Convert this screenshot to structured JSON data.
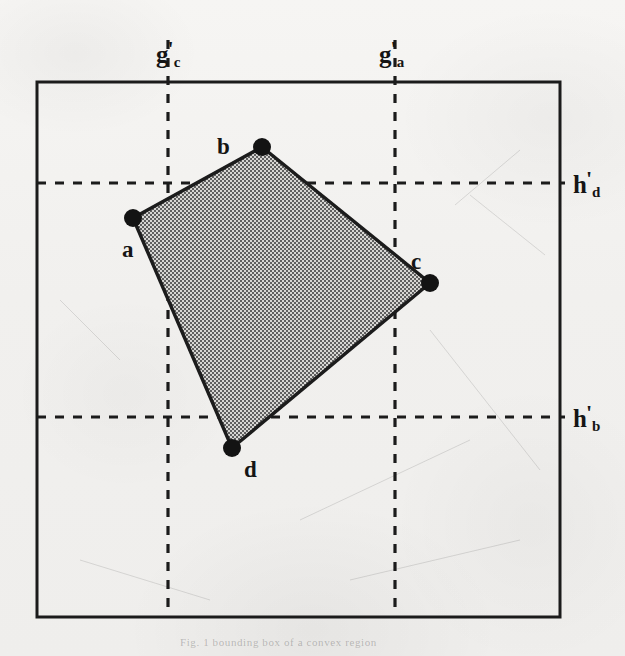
{
  "figure": {
    "background_color": "#f1f0ee",
    "ink_color": "#151515",
    "fill_color": "#8a8a8a",
    "canvas": {
      "width": 625,
      "height": 656
    },
    "frame": {
      "name": "bounding-box",
      "x": 37,
      "y": 82,
      "width": 523,
      "height": 535,
      "stroke_width": 3,
      "color": "#1b1b1b"
    },
    "axis_lines": [
      {
        "id": "g-prime-c",
        "orientation": "vertical",
        "position": 168,
        "label_main": "g",
        "label_sub": "c",
        "label_prime": "'",
        "label_x": 156,
        "label_y": 38,
        "style": "dashed",
        "color": "#1b1b1b"
      },
      {
        "id": "g-prime-a",
        "orientation": "vertical",
        "position": 395,
        "label_main": "g",
        "label_sub": "a",
        "label_prime": "'",
        "label_x": 379,
        "label_y": 38,
        "style": "dashed",
        "color": "#1b1b1b"
      },
      {
        "id": "h-prime-d",
        "orientation": "horizontal",
        "position": 183,
        "label_main": "h",
        "label_sub": "d",
        "label_prime": "'",
        "label_x": 573,
        "label_y": 168,
        "style": "dashed",
        "color": "#1b1b1b"
      },
      {
        "id": "h-prime-b",
        "orientation": "horizontal",
        "position": 417,
        "label_main": "h",
        "label_sub": "b",
        "label_prime": "'",
        "label_x": 573,
        "label_y": 402,
        "style": "dashed",
        "color": "#1b1b1b"
      }
    ],
    "polygon": {
      "name": "shaded-quadrilateral",
      "points": "133,218 262,147 430,283 232,448",
      "fill": "#8a8a8a",
      "stroke": "#1b1b1b",
      "stroke_width": 3
    },
    "vertices": [
      {
        "id": "a",
        "label": "a",
        "x": 133,
        "y": 218,
        "radius": 9,
        "label_x": 122,
        "label_y": 238
      },
      {
        "id": "b",
        "label": "b",
        "x": 262,
        "y": 147,
        "radius": 9,
        "label_x": 217,
        "label_y": 135
      },
      {
        "id": "c",
        "label": "c",
        "x": 430,
        "y": 283,
        "radius": 9,
        "label_x": 411,
        "label_y": 250
      },
      {
        "id": "d",
        "label": "d",
        "x": 232,
        "y": 448,
        "radius": 9,
        "label_x": 244,
        "label_y": 458
      }
    ],
    "footer_smudge": "Fig. 1  bounding box of a convex region"
  }
}
